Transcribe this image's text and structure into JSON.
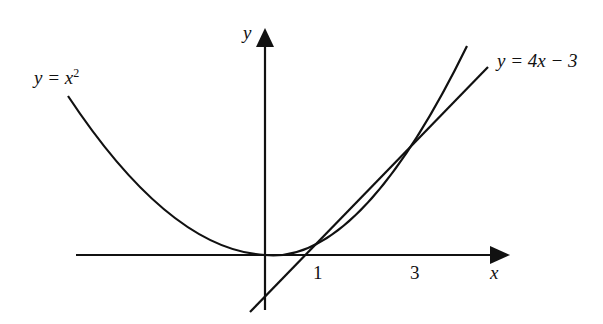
{
  "diagram": {
    "axes": {
      "x_label": "x",
      "y_label": "y"
    },
    "ticks": [
      {
        "label": "1"
      },
      {
        "label": "3"
      }
    ],
    "curves": [
      {
        "name": "parabola",
        "equation_lhs": "y = x",
        "exponent": "2"
      },
      {
        "name": "line",
        "equation": "y = 4x − 3"
      }
    ],
    "intersections": [
      [
        1,
        1
      ],
      [
        3,
        9
      ]
    ],
    "stroke_color": "#111111"
  }
}
